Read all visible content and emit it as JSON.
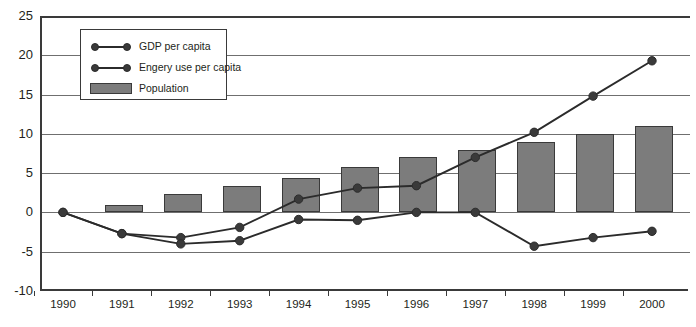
{
  "chart_data": {
    "type": "bar",
    "title": "",
    "xlabel": "",
    "ylabel": "",
    "ylim": [
      -10,
      25
    ],
    "ytick_values": [
      25,
      20,
      15,
      10,
      5,
      0,
      -5,
      -10
    ],
    "ytick_labels": [
      "25",
      "20",
      "15",
      "10",
      "5",
      "0",
      "-5",
      "-10"
    ],
    "grid": true,
    "legend_position": "upper-left-inside",
    "categories": [
      "1990",
      "1991",
      "1992",
      "1993",
      "1994",
      "1995",
      "1996",
      "1997",
      "1998",
      "1999",
      "2000"
    ],
    "series": [
      {
        "name": "GDP per capita",
        "type": "line",
        "marker": "circle",
        "color": "#2b2b2b",
        "values": [
          0,
          -2.7,
          -3.2,
          -1.9,
          1.7,
          3.1,
          3.4,
          7.0,
          10.2,
          14.8,
          19.3
        ]
      },
      {
        "name": "Engery use per capita",
        "type": "line",
        "marker": "circle",
        "color": "#2b2b2b",
        "values": [
          0,
          -2.7,
          -4.0,
          -3.6,
          -0.9,
          -1.0,
          0.0,
          0.0,
          -4.3,
          -3.2,
          -2.4
        ]
      },
      {
        "name": "Population",
        "type": "bar",
        "color": "#7c7c7c",
        "edge_color": "#3a3a3a",
        "values": [
          0,
          1.0,
          2.3,
          3.4,
          4.4,
          5.8,
          7.1,
          8.0,
          9.0,
          10.0,
          11.0
        ]
      }
    ]
  },
  "legend": {
    "items": [
      {
        "label": "GDP per capita",
        "mark": "line-marker"
      },
      {
        "label": "Engery use per capita",
        "mark": "line-marker"
      },
      {
        "label": "Population",
        "mark": "filled-rect"
      }
    ]
  }
}
